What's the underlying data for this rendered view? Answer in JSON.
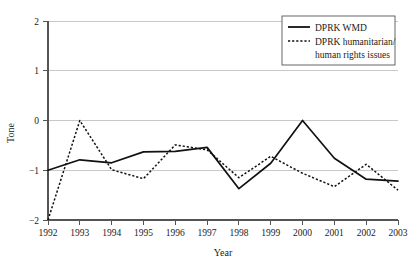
{
  "chart_data": {
    "type": "line",
    "title": "",
    "xlabel": "Year",
    "ylabel": "Tone",
    "x": [
      1992,
      1993,
      1994,
      1995,
      1996,
      1997,
      1998,
      1999,
      2000,
      2001,
      2002,
      2003
    ],
    "xtick_labels": [
      "1992",
      "1993",
      "1994",
      "1995",
      "1996",
      "1997",
      "1998",
      "1999",
      "2000",
      "2001",
      "2002",
      "2003"
    ],
    "ytick_labels": [
      "2",
      "1",
      "0",
      "−1",
      "−2"
    ],
    "ytick_values": [
      2,
      1,
      0,
      -1,
      -2
    ],
    "ylim": [
      -2,
      2
    ],
    "xlim": [
      1992,
      2003
    ],
    "grid": "horizontal",
    "legend_position": "top-right",
    "series": [
      {
        "name": "DPRK WMD",
        "style": "solid",
        "color": "#111111",
        "values": [
          -1.0,
          -0.79,
          -0.85,
          -0.63,
          -0.62,
          -0.54,
          -1.37,
          -0.86,
          0.0,
          -0.76,
          -1.18,
          -1.22
        ]
      },
      {
        "name": "DPRK humanitarian/ human rights issues",
        "style": "dotted",
        "color": "#111111",
        "values": [
          -2.0,
          0.0,
          -0.99,
          -1.17,
          -0.49,
          -0.59,
          -1.15,
          -0.72,
          -1.06,
          -1.33,
          -0.88,
          -1.4
        ]
      }
    ]
  },
  "legend": {
    "entries": [
      {
        "label": "DPRK WMD",
        "line1": "DPRK WMD",
        "line2": ""
      },
      {
        "label": "DPRK humanitarian/ human rights issues",
        "line1": "DPRK humanitarian/",
        "line2": "human rights issues"
      }
    ]
  },
  "axes": {
    "y_title": "Tone",
    "x_title": "Year"
  }
}
